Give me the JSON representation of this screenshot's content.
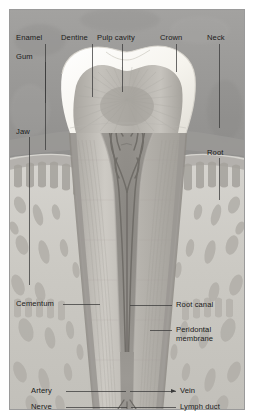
{
  "figure": {
    "type": "anatomical-diagram",
    "width": 254,
    "height": 419
  },
  "palette": {
    "frame_border": "#9a9a9a",
    "page_background": "#ffffff",
    "gum_upper": "#9c9c9c",
    "bone_light": "#cfcdc8",
    "enamel": "#f4f2ec",
    "dentine": "#b9b6b0",
    "pulp": "#8f8c86",
    "vessel": "#6a6762",
    "leader_line": "#3a3a3a",
    "label_text": "#1a1a1a"
  },
  "labels": {
    "enamel": "Enamel",
    "dentine": "Dentine",
    "pulp_cavity": "Pulp cavity",
    "crown": "Crown",
    "neck": "Neck",
    "gum": "Gum",
    "jaw": "Jaw",
    "root": "Root",
    "cementum": "Cementum",
    "root_canal": "Root canal",
    "periodontal_membrane": "Peridontal membrane",
    "artery": "Artery",
    "vein": "Vein",
    "nerve": "Nerve",
    "lymph_duct": "Lymph duct"
  }
}
